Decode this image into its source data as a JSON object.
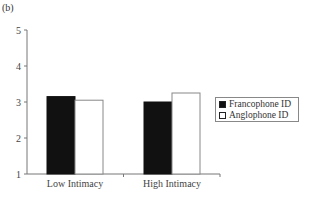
{
  "panel_label": "(b)",
  "chart_data": {
    "type": "bar",
    "title": "",
    "xlabel": "",
    "ylabel": "",
    "ylim": [
      1,
      5
    ],
    "yticks": [
      1,
      2,
      3,
      4,
      5
    ],
    "categories": [
      "Low Intimacy",
      "High Intimacy"
    ],
    "series": [
      {
        "name": "Francophone ID",
        "color": "#111111",
        "values": [
          3.15,
          3.0
        ]
      },
      {
        "name": "Anglophone ID",
        "color": "#ffffff",
        "values": [
          3.05,
          3.25
        ]
      }
    ],
    "grid": false,
    "legend_position": "right"
  },
  "legend": {
    "items": [
      {
        "label": "Francophone ID",
        "color": "#111111"
      },
      {
        "label": "Anglophone ID",
        "color": "#ffffff"
      }
    ]
  }
}
